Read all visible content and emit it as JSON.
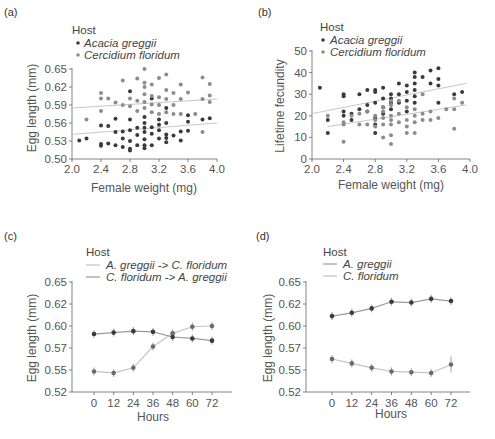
{
  "colors": {
    "acacia": "#3a3a3a",
    "cercidium": "#8c8c8c",
    "fit_line": "#c8c8c8",
    "line_ag_to_cf": "#c4c4c4",
    "line_cf_to_ag": "#9a9a9a",
    "axis": "#555555"
  },
  "panels": {
    "a": {
      "label": "(a)",
      "legend_title": "Host",
      "legend": [
        "Acacia greggii",
        "Cercidium floridum"
      ],
      "xlabel": "Female weight (mg)",
      "ylabel": "Egg length (mm)",
      "xticks": [
        "2.0",
        "2.4",
        "2.8",
        "3.2",
        "3.6",
        "4.0"
      ],
      "yticks": [
        "0.50",
        "0.53",
        "0.56",
        "0.59",
        "0.62",
        "0.65"
      ]
    },
    "b": {
      "label": "(b)",
      "legend_title": "Host",
      "legend": [
        "Acacia greggii",
        "Cercidium floridum"
      ],
      "xlabel": "Female weight (mg)",
      "ylabel": "Lifetime fecundity",
      "xticks": [
        "2.0",
        "2.4",
        "2.8",
        "3.2",
        "3.6",
        "4.0"
      ],
      "yticks": [
        "0",
        "10",
        "20",
        "30",
        "40",
        "50"
      ]
    },
    "c": {
      "label": "(c)",
      "legend_title": "Host",
      "legend": [
        "A. greggii -> C. floridum",
        "C. floridum -> A. greggii"
      ],
      "xlabel": "Hours",
      "ylabel": "Egg length (mm)",
      "xticks": [
        "0",
        "12",
        "24",
        "36",
        "48",
        "60",
        "72"
      ],
      "yticks": [
        "0.52",
        "0.55",
        "0.57",
        "0.60",
        "0.62",
        "0.65"
      ]
    },
    "d": {
      "label": "(d)",
      "legend_title": "Host",
      "legend": [
        "A. greggii",
        "C. floridum"
      ],
      "xlabel": "Hours",
      "ylabel": "Egg length (mm)",
      "xticks": [
        "0",
        "12",
        "24",
        "36",
        "48",
        "60",
        "72"
      ],
      "yticks": [
        "0.52",
        "0.55",
        "0.57",
        "0.60",
        "0.62",
        "0.65"
      ]
    }
  },
  "chart_data": [
    {
      "panel": "(a)",
      "type": "scatter",
      "title": "",
      "xlabel": "Female weight (mg)",
      "ylabel": "Egg length (mm)",
      "xlim": [
        2.0,
        4.0
      ],
      "ylim": [
        0.5,
        0.65
      ],
      "legend_title": "Host",
      "legend_position": "top-left",
      "grid": false,
      "series": [
        {
          "name": "Acacia greggii",
          "color": "#3a3a3a",
          "trend": {
            "x": [
              2.0,
              4.0
            ],
            "y": [
              0.541,
              0.56
            ]
          },
          "points": [
            [
              2.1,
              0.531
            ],
            [
              2.2,
              0.534
            ],
            [
              2.4,
              0.525
            ],
            [
              2.4,
              0.522
            ],
            [
              2.4,
              0.556
            ],
            [
              2.5,
              0.526
            ],
            [
              2.5,
              0.555
            ],
            [
              2.6,
              0.523
            ],
            [
              2.6,
              0.545
            ],
            [
              2.6,
              0.567
            ],
            [
              2.7,
              0.52
            ],
            [
              2.7,
              0.534
            ],
            [
              2.7,
              0.546
            ],
            [
              2.8,
              0.514
            ],
            [
              2.8,
              0.517
            ],
            [
              2.8,
              0.53
            ],
            [
              2.8,
              0.548
            ],
            [
              2.8,
              0.566
            ],
            [
              2.8,
              0.613
            ],
            [
              2.9,
              0.523
            ],
            [
              2.9,
              0.54
            ],
            [
              2.9,
              0.552
            ],
            [
              3.0,
              0.518
            ],
            [
              3.0,
              0.523
            ],
            [
              3.0,
              0.533
            ],
            [
              3.0,
              0.545
            ],
            [
              3.0,
              0.552
            ],
            [
              3.0,
              0.56
            ],
            [
              3.0,
              0.57
            ],
            [
              3.1,
              0.523
            ],
            [
              3.1,
              0.542
            ],
            [
              3.1,
              0.553
            ],
            [
              3.1,
              0.601
            ],
            [
              3.2,
              0.534
            ],
            [
              3.2,
              0.548
            ],
            [
              3.2,
              0.557
            ],
            [
              3.2,
              0.566
            ],
            [
              3.3,
              0.528
            ],
            [
              3.3,
              0.535
            ],
            [
              3.3,
              0.541
            ],
            [
              3.3,
              0.56
            ],
            [
              3.3,
              0.585
            ],
            [
              3.4,
              0.539
            ],
            [
              3.5,
              0.531
            ],
            [
              3.5,
              0.546
            ],
            [
              3.6,
              0.547
            ],
            [
              3.6,
              0.562
            ],
            [
              3.6,
              0.573
            ],
            [
              3.8,
              0.566
            ],
            [
              3.9,
              0.568
            ]
          ]
        },
        {
          "name": "Cercidium floridum",
          "color": "#8c8c8c",
          "trend": {
            "x": [
              2.0,
              4.0
            ],
            "y": [
              0.585,
              0.6
            ]
          },
          "points": [
            [
              2.2,
              0.566
            ],
            [
              2.4,
              0.58
            ],
            [
              2.4,
              0.601
            ],
            [
              2.4,
              0.61
            ],
            [
              2.5,
              0.601
            ],
            [
              2.6,
              0.594
            ],
            [
              2.7,
              0.59
            ],
            [
              2.7,
              0.631
            ],
            [
              2.8,
              0.588
            ],
            [
              2.8,
              0.601
            ],
            [
              2.9,
              0.58
            ],
            [
              2.9,
              0.597
            ],
            [
              2.9,
              0.634
            ],
            [
              3.0,
              0.585
            ],
            [
              3.0,
              0.595
            ],
            [
              3.0,
              0.608
            ],
            [
              3.0,
              0.62
            ],
            [
              3.0,
              0.627
            ],
            [
              3.0,
              0.65
            ],
            [
              3.1,
              0.578
            ],
            [
              3.1,
              0.591
            ],
            [
              3.1,
              0.605
            ],
            [
              3.1,
              0.624
            ],
            [
              3.2,
              0.575
            ],
            [
              3.2,
              0.59
            ],
            [
              3.2,
              0.603
            ],
            [
              3.2,
              0.635
            ],
            [
              3.3,
              0.578
            ],
            [
              3.3,
              0.6
            ],
            [
              3.3,
              0.615
            ],
            [
              3.3,
              0.641
            ],
            [
              3.4,
              0.575
            ],
            [
              3.4,
              0.59
            ],
            [
              3.4,
              0.61
            ],
            [
              3.5,
              0.575
            ],
            [
              3.5,
              0.6
            ],
            [
              3.5,
              0.624
            ],
            [
              3.6,
              0.611
            ],
            [
              3.7,
              0.575
            ],
            [
              3.8,
              0.545
            ],
            [
              3.8,
              0.6
            ],
            [
              3.8,
              0.636
            ],
            [
              3.9,
              0.595
            ],
            [
              3.9,
              0.606
            ],
            [
              3.9,
              0.625
            ]
          ]
        }
      ]
    },
    {
      "panel": "(b)",
      "type": "scatter",
      "title": "",
      "xlabel": "Female weight (mg)",
      "ylabel": "Lifetime fecundity",
      "xlim": [
        2.0,
        4.0
      ],
      "ylim": [
        0,
        50
      ],
      "legend_title": "Host",
      "legend_position": "top-left",
      "grid": false,
      "series": [
        {
          "name": "Acacia greggii",
          "color": "#3a3a3a",
          "trend": {
            "x": [
              2.0,
              3.95
            ],
            "y": [
              21,
              35
            ]
          },
          "points": [
            [
              2.1,
              33
            ],
            [
              2.2,
              12
            ],
            [
              2.2,
              18
            ],
            [
              2.4,
              20
            ],
            [
              2.4,
              22
            ],
            [
              2.4,
              29
            ],
            [
              2.4,
              30
            ],
            [
              2.5,
              18
            ],
            [
              2.5,
              21
            ],
            [
              2.6,
              23
            ],
            [
              2.6,
              30
            ],
            [
              2.7,
              22
            ],
            [
              2.7,
              25
            ],
            [
              2.7,
              32
            ],
            [
              2.8,
              12
            ],
            [
              2.8,
              16
            ],
            [
              2.8,
              19
            ],
            [
              2.8,
              26
            ],
            [
              2.8,
              31
            ],
            [
              2.8,
              32
            ],
            [
              2.9,
              21
            ],
            [
              2.9,
              24
            ],
            [
              2.9,
              28
            ],
            [
              2.9,
              33
            ],
            [
              3.0,
              23
            ],
            [
              3.0,
              26
            ],
            [
              3.0,
              28
            ],
            [
              3.0,
              30
            ],
            [
              3.1,
              26
            ],
            [
              3.1,
              30
            ],
            [
              3.1,
              35
            ],
            [
              3.2,
              22
            ],
            [
              3.2,
              27
            ],
            [
              3.2,
              31
            ],
            [
              3.2,
              34
            ],
            [
              3.3,
              26
            ],
            [
              3.3,
              29
            ],
            [
              3.3,
              32
            ],
            [
              3.3,
              35
            ],
            [
              3.3,
              38
            ],
            [
              3.3,
              40
            ],
            [
              3.4,
              38
            ],
            [
              3.5,
              35
            ],
            [
              3.5,
              41
            ],
            [
              3.6,
              26
            ],
            [
              3.6,
              34
            ],
            [
              3.6,
              37
            ],
            [
              3.6,
              42
            ],
            [
              3.8,
              30
            ],
            [
              3.9,
              31
            ]
          ]
        },
        {
          "name": "Cercidium floridum",
          "color": "#8c8c8c",
          "trend": {
            "x": [
              2.2,
              3.95
            ],
            "y": [
              15,
              25
            ]
          },
          "points": [
            [
              2.2,
              20
            ],
            [
              2.4,
              8
            ],
            [
              2.4,
              16
            ],
            [
              2.4,
              17
            ],
            [
              2.5,
              20
            ],
            [
              2.6,
              16
            ],
            [
              2.6,
              21
            ],
            [
              2.7,
              16
            ],
            [
              2.7,
              22
            ],
            [
              2.8,
              15
            ],
            [
              2.8,
              18
            ],
            [
              2.8,
              20
            ],
            [
              2.9,
              10
            ],
            [
              2.9,
              16
            ],
            [
              2.9,
              19
            ],
            [
              2.9,
              22
            ],
            [
              2.9,
              24
            ],
            [
              3.0,
              7
            ],
            [
              3.0,
              11
            ],
            [
              3.0,
              16
            ],
            [
              3.0,
              18
            ],
            [
              3.0,
              20
            ],
            [
              3.0,
              25
            ],
            [
              3.0,
              27
            ],
            [
              3.1,
              17
            ],
            [
              3.1,
              21
            ],
            [
              3.1,
              27
            ],
            [
              3.2,
              12
            ],
            [
              3.2,
              15
            ],
            [
              3.2,
              18
            ],
            [
              3.2,
              24
            ],
            [
              3.3,
              12
            ],
            [
              3.3,
              17
            ],
            [
              3.3,
              20
            ],
            [
              3.3,
              23
            ],
            [
              3.4,
              18
            ],
            [
              3.4,
              21
            ],
            [
              3.4,
              30
            ],
            [
              3.5,
              18
            ],
            [
              3.5,
              22
            ],
            [
              3.6,
              19
            ],
            [
              3.7,
              23
            ],
            [
              3.8,
              14
            ],
            [
              3.8,
              23
            ],
            [
              3.8,
              28
            ],
            [
              3.9,
              26
            ]
          ]
        }
      ]
    },
    {
      "panel": "(c)",
      "type": "line",
      "title": "",
      "xlabel": "Hours",
      "ylabel": "Egg length (mm)",
      "categories": [
        "0",
        "12",
        "24",
        "36",
        "48",
        "60",
        "72"
      ],
      "x": [
        0,
        12,
        24,
        36,
        48,
        60,
        72
      ],
      "ytick_labels": [
        "0.52",
        "0.55",
        "0.57",
        "0.60",
        "0.62",
        "0.65"
      ],
      "ylim": [
        0.52,
        0.65
      ],
      "legend_title": "Host",
      "legend_position": "top-left",
      "grid": false,
      "error_bars": true,
      "series": [
        {
          "name": "A. greggii -> C. floridum",
          "color": "#c4c4c4",
          "values": [
            0.548,
            0.546,
            0.552,
            0.572,
            0.59,
            0.599,
            0.6
          ]
        },
        {
          "name": "C. floridum -> A. greggii",
          "color": "#9a9a9a",
          "values": [
            0.589,
            0.591,
            0.593,
            0.592,
            0.585,
            0.583,
            0.58
          ]
        }
      ]
    },
    {
      "panel": "(d)",
      "type": "line",
      "title": "",
      "xlabel": "Hours",
      "ylabel": "Egg length (mm)",
      "categories": [
        "0",
        "12",
        "24",
        "36",
        "48",
        "60",
        "72"
      ],
      "x": [
        0,
        12,
        24,
        36,
        48,
        60,
        72
      ],
      "ytick_labels": [
        "0.52",
        "0.55",
        "0.57",
        "0.60",
        "0.62",
        "0.65"
      ],
      "ylim": [
        0.52,
        0.65
      ],
      "legend_title": "Host",
      "legend_position": "top-left",
      "grid": false,
      "error_bars": true,
      "series": [
        {
          "name": "A. greggii",
          "color": "#9a9a9a",
          "values": [
            0.609,
            0.612,
            0.616,
            0.623,
            0.622,
            0.627,
            0.624
          ]
        },
        {
          "name": "C. floridum",
          "color": "#c4c4c4",
          "values": [
            0.56,
            0.556,
            0.552,
            0.548,
            0.547,
            0.546,
            0.555
          ]
        }
      ]
    }
  ]
}
